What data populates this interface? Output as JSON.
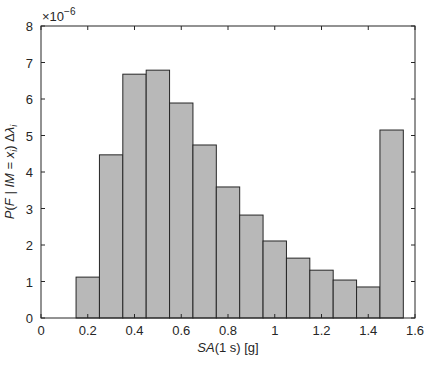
{
  "chart_data": {
    "type": "bar",
    "title": "",
    "xlabel": "SA(1 s) [g]",
    "ylabel": "P(F | IM = x_i) Δλ_i",
    "y_multiplier": "×10^-6",
    "xlim": [
      0,
      1.6
    ],
    "ylim": [
      0,
      8
    ],
    "xticks": [
      "0",
      "0.2",
      "0.4",
      "0.6",
      "0.8",
      "1",
      "1.2",
      "1.4",
      "1.6"
    ],
    "yticks": [
      "0",
      "1",
      "2",
      "3",
      "4",
      "5",
      "6",
      "7",
      "8"
    ],
    "grid": false,
    "bin_width": 0.1,
    "bin_centers": [
      0.1,
      0.2,
      0.3,
      0.4,
      0.5,
      0.6,
      0.7,
      0.8,
      0.9,
      1.0,
      1.1,
      1.2,
      1.3,
      1.4,
      1.5
    ],
    "values": [
      0.0,
      1.12,
      4.47,
      6.68,
      6.79,
      5.89,
      4.74,
      3.59,
      2.82,
      2.11,
      1.64,
      1.31,
      1.04,
      0.85,
      5.15
    ],
    "bar_color": "#b8b8b8",
    "edge_color": "#262626"
  }
}
